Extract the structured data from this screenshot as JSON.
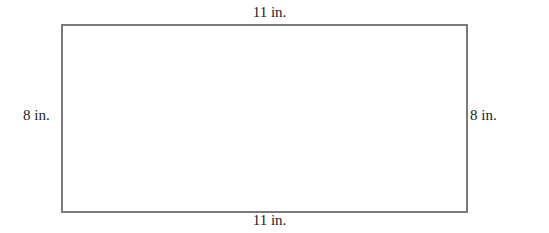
{
  "diagram": {
    "shape": "rectangle",
    "labels": {
      "top": "11 in.",
      "bottom": "11 in.",
      "left": "8 in.",
      "right": "8 in."
    },
    "stroke_color": "#7a7a7a"
  }
}
